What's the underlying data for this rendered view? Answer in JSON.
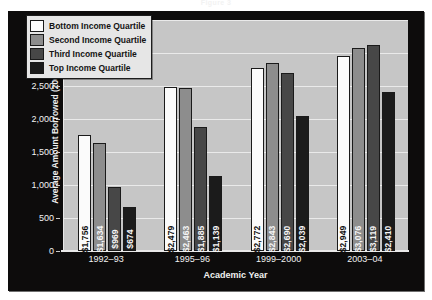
{
  "figure": {
    "title_cropped": "Figure 3"
  },
  "chart_data": {
    "type": "bar",
    "title": "",
    "xlabel": "Academic Year",
    "ylabel": "Average Amount Borrowed (2008 Dollars)",
    "categories": [
      "1992–93",
      "1995–96",
      "1999–2000",
      "2003–04"
    ],
    "ylim": [
      0,
      3500
    ],
    "ytick_labels": [
      "0",
      "500",
      "1,000",
      "1,500",
      "2,000",
      "2,500",
      "3,000",
      "3,500"
    ],
    "ytick_values": [
      0,
      500,
      1000,
      1500,
      2000,
      2500,
      3000,
      3500
    ],
    "grid": true,
    "legend_position": "top-left",
    "series": [
      {
        "name": "Bottom Income Quartile",
        "color": "#fbfbfb",
        "values": [
          1756,
          2479,
          2772,
          2949
        ],
        "labels": [
          "$1,756",
          "$2,479",
          "$2,772",
          "$2,949"
        ]
      },
      {
        "name": "Second Income Quartile",
        "color": "#8d8d8d",
        "values": [
          1634,
          2463,
          2843,
          3076
        ],
        "labels": [
          "$1,634",
          "$2,463",
          "$2,843",
          "$3,076"
        ]
      },
      {
        "name": "Third Income Quartile",
        "color": "#474747",
        "values": [
          969,
          1885,
          2690,
          3119
        ],
        "labels": [
          "$969",
          "$1,885",
          "$2,690",
          "$3,119"
        ]
      },
      {
        "name": "Top Income Quartile",
        "color": "#1b1b1b",
        "values": [
          674,
          1139,
          2039,
          2410
        ],
        "labels": [
          "$674",
          "$1,139",
          "$2,039",
          "$2,410"
        ]
      }
    ]
  }
}
